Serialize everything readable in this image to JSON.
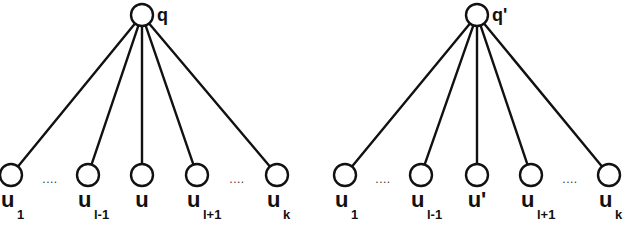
{
  "diagram": {
    "type": "tree",
    "trees": [
      {
        "name": "left",
        "root": {
          "label": "q",
          "x": 142,
          "y": 15
        },
        "leaves": [
          {
            "main": "u",
            "sub": "1",
            "x": 11
          },
          {
            "main": "u",
            "sub": "l-1",
            "x": 88
          },
          {
            "main": "u",
            "sub": "",
            "x": 142
          },
          {
            "main": "u",
            "sub": "l+1",
            "x": 197
          },
          {
            "main": "u",
            "sub": "k",
            "x": 277
          }
        ],
        "ellipses": [
          {
            "text": "....",
            "x": 50
          },
          {
            "text": "....",
            "x": 237
          }
        ]
      },
      {
        "name": "right",
        "root": {
          "label": "q'",
          "x": 477,
          "y": 15
        },
        "leaves": [
          {
            "main": "u",
            "sub": "1",
            "x": 345
          },
          {
            "main": "u",
            "sub": "l-1",
            "x": 421
          },
          {
            "main": "u'",
            "sub": "",
            "x": 477
          },
          {
            "main": "u",
            "sub": "l+1",
            "x": 531
          },
          {
            "main": "u",
            "sub": "k",
            "x": 609
          }
        ],
        "ellipses": [
          {
            "text": "....",
            "x": 383
          },
          {
            "text": "....",
            "x": 570
          }
        ]
      }
    ]
  }
}
